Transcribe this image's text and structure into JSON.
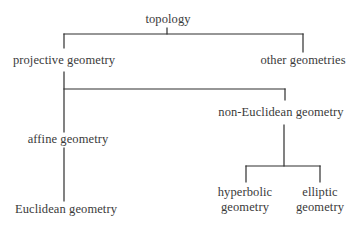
{
  "diagram": {
    "type": "tree",
    "colors": {
      "background": "#ffffff",
      "text": "#3a3a3a",
      "line": "#2e2e2e"
    },
    "nodes": {
      "topology": {
        "label": "topology"
      },
      "projective": {
        "label": "projective geometry"
      },
      "other": {
        "label": "other geometries"
      },
      "affine": {
        "label": "affine geometry"
      },
      "non_euclidean": {
        "label": "non-Euclidean geometry"
      },
      "euclidean": {
        "label": "Euclidean geometry"
      },
      "hyperbolic": {
        "label_line1": "hyperbolic",
        "label_line2": "geometry"
      },
      "elliptic": {
        "label_line1": "elliptic",
        "label_line2": "geometry"
      }
    },
    "edges": [
      {
        "from": "topology",
        "to": "projective"
      },
      {
        "from": "topology",
        "to": "other"
      },
      {
        "from": "projective",
        "to": "affine"
      },
      {
        "from": "projective",
        "to": "non_euclidean"
      },
      {
        "from": "affine",
        "to": "euclidean"
      },
      {
        "from": "non_euclidean",
        "to": "hyperbolic"
      },
      {
        "from": "non_euclidean",
        "to": "elliptic"
      }
    ]
  }
}
